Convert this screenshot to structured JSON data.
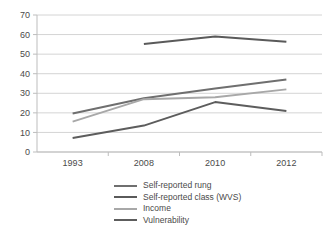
{
  "chart_data": {
    "type": "line",
    "title": "",
    "xlabel": "",
    "ylabel": "",
    "categories": [
      "1993",
      "2008",
      "2010",
      "2012"
    ],
    "ylim": [
      0,
      70
    ],
    "y_ticks": [
      0,
      10,
      20,
      30,
      40,
      50,
      60,
      70
    ],
    "grid": true,
    "legend_position": "bottom",
    "series": [
      {
        "name": "Self-reported rung",
        "color": "#6f6f6f",
        "values": [
          19.7,
          27.5,
          32.5,
          37.0
        ]
      },
      {
        "name": "Self-reported class (WVS)",
        "color": "#5a5a5a",
        "values": [
          null,
          55.2,
          59.0,
          56.3
        ]
      },
      {
        "name": "Income",
        "color": "#a8a8a8",
        "values": [
          15.5,
          27.0,
          28.0,
          32.0
        ]
      },
      {
        "name": "Vulnerability",
        "color": "#5d5d5d",
        "values": [
          7.2,
          13.5,
          25.5,
          21.0
        ]
      }
    ]
  },
  "legend": {
    "items": [
      {
        "label": "Self-reported rung"
      },
      {
        "label": "Self-reported class (WVS)"
      },
      {
        "label": "Income"
      },
      {
        "label": "Vulnerability"
      }
    ]
  },
  "axes": {
    "y_tick_labels": [
      "70",
      "60",
      "50",
      "40",
      "30",
      "20",
      "10",
      "0"
    ],
    "x_tick_labels": [
      "1993",
      "2008",
      "2010",
      "2012"
    ]
  },
  "colors": {
    "gridline": "#d4d4d4",
    "axis": "#bdbdbd",
    "text": "#4a4a4a",
    "background": "#ffffff"
  }
}
